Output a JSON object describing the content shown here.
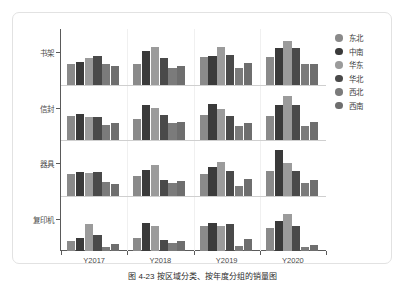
{
  "caption": "图 4-23  按区域分类、按年度分组的销量图",
  "legend": {
    "title": "",
    "items": [
      {
        "label": "东北",
        "color": "#8a8a8a"
      },
      {
        "label": "中南",
        "color": "#3a3a3a"
      },
      {
        "label": "华东",
        "color": "#9b9b9b"
      },
      {
        "label": "华北",
        "color": "#4a4a4a"
      },
      {
        "label": "西北",
        "color": "#7b7b7b"
      },
      {
        "label": "西南",
        "color": "#6e6e6e"
      }
    ]
  },
  "chart_data": {
    "type": "bar",
    "title": "",
    "xlabel": "",
    "ylabel": "",
    "grid": true,
    "legend_position": "right",
    "facet_rows": [
      "书架",
      "信封",
      "器具",
      "复印机"
    ],
    "categories": [
      "Y2017",
      "Y2018",
      "Y2019",
      "Y2020"
    ],
    "series_names": [
      "东北",
      "中南",
      "华东",
      "华北",
      "西北",
      "西南"
    ],
    "series_colors": [
      "#8a8a8a",
      "#3a3a3a",
      "#9b9b9b",
      "#4a4a4a",
      "#7b7b7b",
      "#6e6e6e"
    ],
    "ylim": [
      0,
      100
    ],
    "panels": [
      {
        "row": "书架",
        "groups": [
          {
            "category": "Y2017",
            "values": [
              40,
              44,
              52,
              56,
              40,
              37
            ]
          },
          {
            "category": "Y2018",
            "values": [
              40,
              67,
              75,
              53,
              32,
              37
            ]
          },
          {
            "category": "Y2019",
            "values": [
              54,
              57,
              75,
              58,
              32,
              43
            ]
          },
          {
            "category": "Y2020",
            "values": [
              55,
              72,
              87,
              73,
              41,
              40
            ]
          }
        ]
      },
      {
        "row": "信封",
        "groups": [
          {
            "category": "Y2017",
            "values": [
              48,
              51,
              45,
              45,
              29,
              33
            ]
          },
          {
            "category": "Y2018",
            "values": [
              41,
              70,
              63,
              50,
              33,
              35
            ]
          },
          {
            "category": "Y2019",
            "values": [
              50,
              72,
              61,
              47,
              28,
              33
            ]
          },
          {
            "category": "Y2020",
            "values": [
              48,
              70,
              88,
              70,
              28,
              35
            ]
          }
        ]
      },
      {
        "row": "器具",
        "groups": [
          {
            "category": "Y2017",
            "values": [
              43,
              47,
              44,
              47,
              26,
              22
            ]
          },
          {
            "category": "Y2018",
            "values": [
              38,
              50,
              60,
              30,
              24,
              29
            ]
          },
          {
            "category": "Y2019",
            "values": [
              42,
              56,
              67,
              48,
              18,
              32
            ]
          },
          {
            "category": "Y2020",
            "values": [
              49,
              91,
              65,
              48,
              25,
              31
            ]
          }
        ]
      },
      {
        "row": "复印机",
        "groups": [
          {
            "category": "Y2017",
            "values": [
              20,
              26,
              53,
              31,
              7,
              13
            ]
          },
          {
            "category": "Y2018",
            "values": [
              25,
              56,
              50,
              21,
              16,
              20
            ]
          },
          {
            "category": "Y2019",
            "values": [
              50,
              55,
              50,
              54,
              9,
              24
            ]
          },
          {
            "category": "Y2020",
            "values": [
              45,
              59,
              73,
              50,
              7,
              12
            ]
          }
        ]
      }
    ]
  }
}
